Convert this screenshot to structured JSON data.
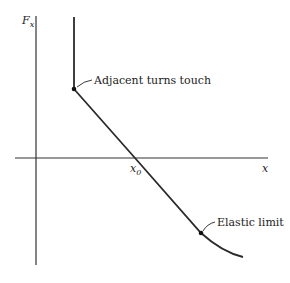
{
  "diagram": {
    "y_axis_label": "F",
    "y_axis_sub": "x",
    "x_axis_label": "x",
    "x0_label": "x",
    "x0_sub": "0",
    "annotations": [
      {
        "label": "Adjacent turns touch"
      },
      {
        "label": "Elastic limit"
      }
    ],
    "colors": {
      "line": "#2a2a2a",
      "axis": "#333333"
    }
  }
}
